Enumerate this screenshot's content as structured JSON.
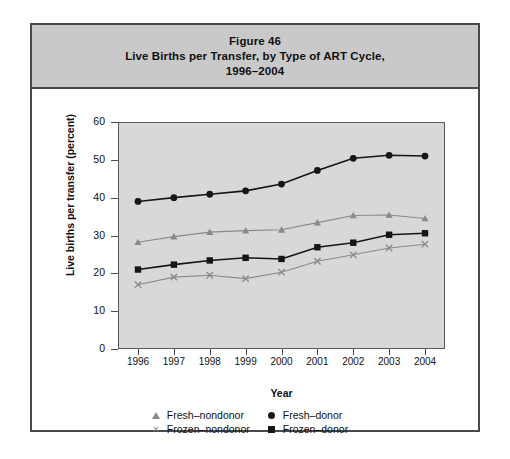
{
  "figure": {
    "title_lines": [
      "Figure 46",
      "Live Births per Transfer, by Type of ART Cycle,",
      "1996–2004"
    ]
  },
  "axes": {
    "x_title": "Year",
    "y_title": "Live births per transfer (percent)",
    "y_ticks": [
      "0",
      "10",
      "20",
      "30",
      "40",
      "50",
      "60"
    ],
    "x_ticks": [
      "1996",
      "1997",
      "1998",
      "1999",
      "2000",
      "2001",
      "2002",
      "2003",
      "2004"
    ]
  },
  "legend": {
    "items": [
      {
        "label": "Fresh–nondonor",
        "marker": "triangle-marker",
        "color": "#8a8a8a"
      },
      {
        "label": "Fresh–donor",
        "marker": "circle-marker",
        "color": "#161616"
      },
      {
        "label": "Frozen–nondonor",
        "marker": "cross-marker",
        "color": "#8a8a8a"
      },
      {
        "label": "Frozen–donor",
        "marker": "square-marker",
        "color": "#161616"
      }
    ]
  },
  "chart_data": {
    "type": "line",
    "xlabel": "Year",
    "ylabel": "Live births per transfer (percent)",
    "x": [
      1996,
      1997,
      1998,
      1999,
      2000,
      2001,
      2002,
      2003,
      2004
    ],
    "categories": [
      "1996",
      "1997",
      "1998",
      "1999",
      "2000",
      "2001",
      "2002",
      "2003",
      "2004"
    ],
    "xlim": [
      1996,
      2004
    ],
    "ylim": [
      0,
      60
    ],
    "yticks": [
      0,
      10,
      20,
      30,
      40,
      50,
      60
    ],
    "grid": false,
    "legend_position": "bottom",
    "series": [
      {
        "name": "Fresh–donor",
        "marker": "circle",
        "color": "#161616",
        "values": [
          39.0,
          40.0,
          40.9,
          41.8,
          43.6,
          47.2,
          50.4,
          51.2,
          51.0
        ]
      },
      {
        "name": "Fresh–nondonor",
        "marker": "triangle",
        "color": "#8a8a8a",
        "values": [
          28.2,
          29.7,
          30.9,
          31.3,
          31.5,
          33.4,
          35.3,
          35.4,
          34.5
        ]
      },
      {
        "name": "Frozen–donor",
        "marker": "square",
        "color": "#161616",
        "values": [
          21.0,
          22.3,
          23.4,
          24.1,
          23.8,
          26.9,
          28.1,
          30.2,
          30.6
        ]
      },
      {
        "name": "Frozen–nondonor",
        "marker": "cross",
        "color": "#8a8a8a",
        "values": [
          17.0,
          19.0,
          19.5,
          18.6,
          20.3,
          23.2,
          24.9,
          26.7,
          27.7
        ]
      }
    ]
  }
}
